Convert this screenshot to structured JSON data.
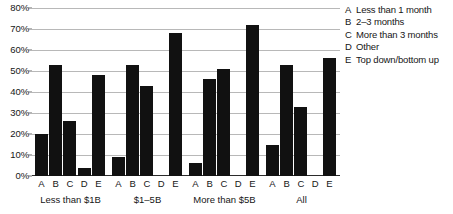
{
  "chart_data": {
    "type": "bar",
    "title": "",
    "subtitle": "",
    "xlabel": "",
    "ylabel": "",
    "ylim": [
      0,
      80
    ],
    "ytick_labels": [
      "0%",
      "10%",
      "20%",
      "30%",
      "40%",
      "50%",
      "60%",
      "70%",
      "80%"
    ],
    "ytick_values": [
      0,
      10,
      20,
      30,
      40,
      50,
      60,
      70,
      80
    ],
    "grid": true,
    "legend_position": "right",
    "bar_color": "#111111",
    "categories": [
      "Less than $1B",
      "$1–5B",
      "More than $5B",
      "All"
    ],
    "series_keys": [
      "A",
      "B",
      "C",
      "D",
      "E"
    ],
    "series": [
      {
        "name": "A",
        "label": "Less than 1 month",
        "values": [
          20,
          9,
          6,
          15
        ]
      },
      {
        "name": "B",
        "label": "2–3 months",
        "values": [
          53,
          53,
          46,
          53
        ]
      },
      {
        "name": "C",
        "label": "More than 3 months",
        "values": [
          26,
          43,
          51,
          33
        ]
      },
      {
        "name": "D",
        "label": "Other",
        "values": [
          4,
          0,
          0,
          0
        ]
      },
      {
        "name": "E",
        "label": "Top down/bottom up",
        "values": [
          48,
          68,
          72,
          56
        ]
      }
    ]
  },
  "legend": {
    "items": [
      {
        "key": "A",
        "label": "Less than 1 month"
      },
      {
        "key": "B",
        "label": "2–3 months"
      },
      {
        "key": "C",
        "label": "More than 3 months"
      },
      {
        "key": "D",
        "label": "Other"
      },
      {
        "key": "E",
        "label": "Top down/bottom up"
      }
    ]
  }
}
